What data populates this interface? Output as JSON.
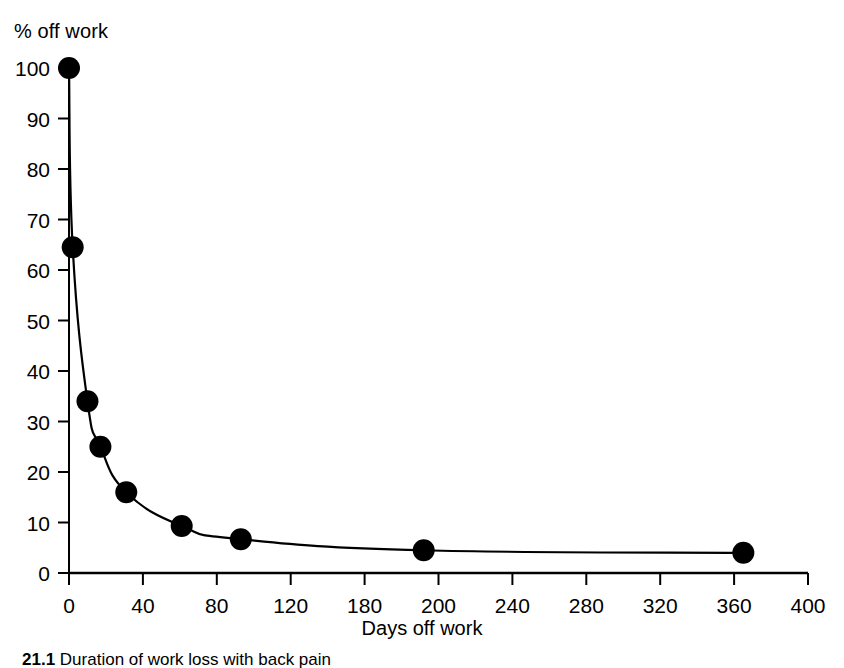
{
  "chart_data": {
    "type": "line",
    "title": "",
    "xlabel": "Days off work",
    "ylabel": "% off work",
    "xlim": [
      0,
      400
    ],
    "ylim": [
      0,
      100
    ],
    "grid": false,
    "legend": "none",
    "marker": "filled-circle",
    "line_color": "#000000",
    "marker_color": "#000000",
    "xticks": [
      0,
      40,
      80,
      120,
      160,
      200,
      240,
      280,
      320,
      360,
      400
    ],
    "xtick_labels": [
      "0",
      "40",
      "80",
      "120",
      "180",
      "200",
      "240",
      "280",
      "320",
      "360",
      "400"
    ],
    "yticks": [
      0,
      10,
      20,
      30,
      40,
      50,
      60,
      70,
      80,
      90,
      100
    ],
    "ytick_labels": [
      "0",
      "10",
      "20",
      "30",
      "40",
      "50",
      "60",
      "70",
      "80",
      "90",
      "100"
    ],
    "series": [
      {
        "name": "% off work",
        "x": [
          0,
          2,
          10,
          17,
          31,
          61,
          93,
          192,
          365
        ],
        "y": [
          100,
          64.5,
          34,
          25,
          16,
          9.3,
          6.7,
          4.5,
          4
        ]
      }
    ]
  },
  "caption": {
    "number": "21.1",
    "text": "Duration of work loss with back pain"
  }
}
